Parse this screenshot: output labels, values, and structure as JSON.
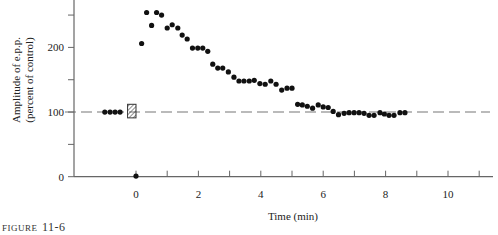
{
  "chart_data": {
    "type": "scatter",
    "title": "",
    "xlabel": "Time (min)",
    "ylabel_lines": [
      "Amplitude of e.p.p.",
      "(percent of control)"
    ],
    "xlim": [
      -2.0,
      11.5
    ],
    "ylim": [
      0,
      273
    ],
    "x_ticks": [
      -1,
      0,
      1,
      2,
      3,
      4,
      5,
      6,
      7,
      8,
      9,
      10,
      11
    ],
    "x_tick_labels": [
      {
        "value": 0,
        "label": "0"
      },
      {
        "value": 2,
        "label": "2"
      },
      {
        "value": 4,
        "label": "4"
      },
      {
        "value": 6,
        "label": "6"
      },
      {
        "value": 8,
        "label": "8"
      },
      {
        "value": 10,
        "label": "10"
      }
    ],
    "y_ticks": [
      0,
      50,
      100,
      150,
      200,
      250
    ],
    "y_tick_labels": [
      {
        "value": 0,
        "label": "0"
      },
      {
        "value": 100,
        "label": "100"
      },
      {
        "value": 200,
        "label": "200"
      }
    ],
    "reference_line": {
      "y": 100,
      "style": "dashed",
      "x_from": -2.0,
      "x_to": 11.3
    },
    "stimulus_box": {
      "x_from": -0.27,
      "x_to": 0.0,
      "y_from": 91,
      "y_to": 112,
      "pattern": "hatched"
    },
    "grid": false,
    "legend": "none",
    "series": [
      {
        "name": "pre-stimulus",
        "points": [
          [
            -1.0,
            100
          ],
          [
            -0.83,
            100
          ],
          [
            -0.67,
            100
          ],
          [
            -0.51,
            100
          ]
        ]
      },
      {
        "name": "post-tetanic depression",
        "points": [
          [
            0.0,
            1
          ]
        ]
      },
      {
        "name": "post-tetanic potentiation",
        "points": [
          [
            0.18,
            206
          ],
          [
            0.34,
            254
          ],
          [
            0.5,
            234
          ],
          [
            0.66,
            254
          ],
          [
            0.82,
            250
          ],
          [
            1.0,
            230
          ],
          [
            1.16,
            235
          ],
          [
            1.34,
            230
          ],
          [
            1.48,
            219
          ],
          [
            1.64,
            213
          ],
          [
            1.81,
            199
          ],
          [
            1.98,
            199
          ],
          [
            2.14,
            199
          ],
          [
            2.3,
            194
          ],
          [
            2.46,
            174
          ],
          [
            2.62,
            168
          ],
          [
            2.78,
            168
          ],
          [
            2.96,
            162
          ],
          [
            3.14,
            154
          ],
          [
            3.3,
            148
          ],
          [
            3.46,
            148
          ],
          [
            3.63,
            148
          ],
          [
            3.79,
            149
          ],
          [
            3.97,
            144
          ],
          [
            4.14,
            143
          ],
          [
            4.32,
            148
          ],
          [
            4.49,
            143
          ],
          [
            4.67,
            134
          ],
          [
            4.84,
            137
          ],
          [
            5.0,
            137
          ],
          [
            5.18,
            112
          ],
          [
            5.33,
            111
          ],
          [
            5.49,
            109
          ],
          [
            5.66,
            106
          ],
          [
            5.84,
            111
          ],
          [
            6.0,
            108
          ],
          [
            6.16,
            107
          ],
          [
            6.32,
            101
          ],
          [
            6.49,
            96
          ],
          [
            6.67,
            98
          ],
          [
            6.83,
            99
          ],
          [
            6.99,
            99
          ],
          [
            7.15,
            99
          ],
          [
            7.31,
            98
          ],
          [
            7.47,
            95
          ],
          [
            7.63,
            95
          ],
          [
            7.82,
            99
          ],
          [
            7.96,
            97
          ],
          [
            8.11,
            95
          ],
          [
            8.27,
            95
          ],
          [
            8.46,
            99
          ],
          [
            8.62,
            99
          ]
        ]
      }
    ]
  },
  "caption": {
    "word": "FIGURE",
    "number": "11-6"
  }
}
